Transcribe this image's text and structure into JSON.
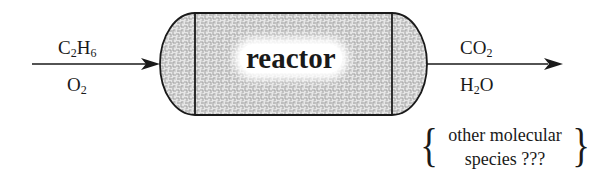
{
  "diagram": {
    "title": "",
    "inputs": [
      {
        "formula_main": "C",
        "sub1": "2",
        "mid": "H",
        "sub2": "6"
      },
      {
        "formula_main": "O",
        "sub1": "2"
      }
    ],
    "reactor": {
      "label": "reactor"
    },
    "outputs": [
      {
        "formula_main": "CO",
        "sub1": "2"
      },
      {
        "formula_main": "H",
        "sub1": "2",
        "tail": "O"
      }
    ],
    "other_species": {
      "line1": "other molecular",
      "line2": "species ???",
      "brace_left": "{",
      "brace_right": "}"
    },
    "colors": {
      "stroke": "#1a1a1a",
      "fill_pattern": "#b8b8b8",
      "background": "#ffffff"
    }
  }
}
